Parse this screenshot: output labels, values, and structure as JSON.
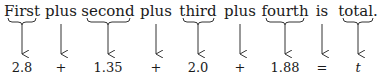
{
  "diagram": {
    "columns": [
      {
        "word": "First",
        "value": "2.8",
        "x": 22,
        "brace": true
      },
      {
        "word": "plus",
        "value": "+",
        "x": 61,
        "brace": false
      },
      {
        "word": "second",
        "value": "1.35",
        "x": 108,
        "brace": true
      },
      {
        "word": "plus",
        "value": "+",
        "x": 156,
        "brace": false
      },
      {
        "word": "third",
        "value": "2.0",
        "x": 198,
        "brace": true
      },
      {
        "word": "plus",
        "value": "+",
        "x": 240,
        "brace": false
      },
      {
        "word": "fourth",
        "value": "1.88",
        "x": 285,
        "brace": true
      },
      {
        "word": "is",
        "value": "=",
        "x": 322,
        "brace": false
      },
      {
        "word": "total.",
        "value": "t",
        "x": 358,
        "brace": true
      }
    ]
  }
}
